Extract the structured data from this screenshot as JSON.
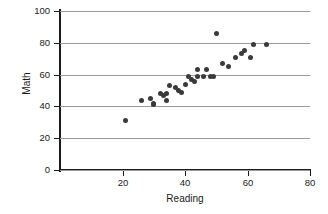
{
  "chart_data": {
    "type": "scatter",
    "title": "",
    "xlabel": "Reading",
    "ylabel": "Math",
    "xlim": [
      0,
      80
    ],
    "ylim": [
      0,
      100
    ],
    "xticks": [
      20,
      40,
      60,
      80
    ],
    "yticks": [
      0,
      20,
      40,
      60,
      80,
      100
    ],
    "grid": "horizontal",
    "legend": "none",
    "marker_color": "#3a3a3a",
    "axis_color": "#1a1a1a",
    "gridline_color": "#9a9a9a",
    "points": [
      {
        "x": 21,
        "y": 31
      },
      {
        "x": 26,
        "y": 44
      },
      {
        "x": 29,
        "y": 45
      },
      {
        "x": 30,
        "y": 42
      },
      {
        "x": 30,
        "y": 41
      },
      {
        "x": 32,
        "y": 48
      },
      {
        "x": 33,
        "y": 47
      },
      {
        "x": 34,
        "y": 48
      },
      {
        "x": 34,
        "y": 44
      },
      {
        "x": 35,
        "y": 53
      },
      {
        "x": 37,
        "y": 52
      },
      {
        "x": 38,
        "y": 50
      },
      {
        "x": 39,
        "y": 49
      },
      {
        "x": 40,
        "y": 54
      },
      {
        "x": 41,
        "y": 59
      },
      {
        "x": 42,
        "y": 57
      },
      {
        "x": 43,
        "y": 56
      },
      {
        "x": 44,
        "y": 63
      },
      {
        "x": 44,
        "y": 59
      },
      {
        "x": 46,
        "y": 59
      },
      {
        "x": 47,
        "y": 63
      },
      {
        "x": 48,
        "y": 59
      },
      {
        "x": 49,
        "y": 59
      },
      {
        "x": 50,
        "y": 86
      },
      {
        "x": 52,
        "y": 67
      },
      {
        "x": 54,
        "y": 65
      },
      {
        "x": 56,
        "y": 71
      },
      {
        "x": 58,
        "y": 73
      },
      {
        "x": 59,
        "y": 75
      },
      {
        "x": 61,
        "y": 71
      },
      {
        "x": 62,
        "y": 79
      },
      {
        "x": 66,
        "y": 79
      }
    ]
  },
  "y_tick_labels": [
    "100",
    "80",
    "60",
    "40",
    "20",
    "0"
  ],
  "x_tick_labels": [
    "20",
    "40",
    "60",
    "80"
  ]
}
